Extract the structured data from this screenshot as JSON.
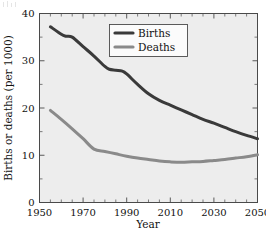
{
  "chart_data": {
    "type": "line",
    "title": "",
    "xlabel": "Year",
    "ylabel": "Births or deaths (per 1000)",
    "xlim": [
      1950,
      2050
    ],
    "ylim": [
      0,
      40
    ],
    "xticks": [
      1950,
      1970,
      1990,
      2010,
      2030,
      2050
    ],
    "xtick_labels": [
      "1950",
      "1970",
      "1990",
      "2010",
      "2030",
      "2050"
    ],
    "xminor_step": 5,
    "yticks": [
      0,
      10,
      20,
      30,
      40
    ],
    "ytick_labels": [
      "0",
      "10",
      "20",
      "30",
      "40"
    ],
    "yminor_step": 5,
    "grid": false,
    "legend_position": "upper-center-right",
    "background_color": "#ededed",
    "series": [
      {
        "name": "Births",
        "color": "#3a3a3a",
        "x": [
          1955,
          1960,
          1962,
          1965,
          1970,
          1975,
          1980,
          1982,
          1985,
          1988,
          1990,
          1995,
          2000,
          2005,
          2010,
          2015,
          2020,
          2025,
          2030,
          2035,
          2040,
          2045,
          2050
        ],
        "values": [
          37.2,
          35.6,
          35.2,
          35.0,
          33.0,
          31.0,
          28.8,
          28.2,
          28.0,
          27.8,
          27.2,
          25.0,
          23.0,
          21.6,
          20.6,
          19.6,
          18.6,
          17.6,
          16.8,
          15.9,
          15.0,
          14.2,
          13.5
        ]
      },
      {
        "name": "Deaths",
        "color": "#8a8a8a",
        "x": [
          1955,
          1960,
          1965,
          1970,
          1975,
          1980,
          1985,
          1990,
          1995,
          2000,
          2005,
          2010,
          2015,
          2020,
          2025,
          2030,
          2035,
          2040,
          2045,
          2050
        ],
        "values": [
          19.5,
          17.6,
          15.6,
          13.5,
          11.3,
          10.8,
          10.3,
          9.8,
          9.4,
          9.1,
          8.8,
          8.6,
          8.5,
          8.6,
          8.7,
          8.9,
          9.1,
          9.4,
          9.7,
          10.1
        ]
      }
    ],
    "legend_entries": [
      "Births",
      "Deaths"
    ]
  }
}
